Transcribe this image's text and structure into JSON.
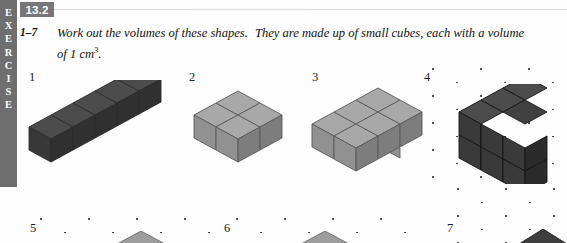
{
  "page": {
    "exercise_tab_letters": [
      "E",
      "X",
      "E",
      "R",
      "C",
      "I",
      "S",
      "E"
    ],
    "badge_label": "13.2",
    "question_range": "1–7",
    "instruction_line1": "Work out the volumes of these shapes.",
    "instruction_line1b": "They are made up of small cubes, each with a volume",
    "instruction_line2_pre": "of 1 cm",
    "instruction_line2_sup": "3",
    "instruction_line2_post": "."
  },
  "colors": {
    "tab_background": "#6e6e6e",
    "tab_text": "#ffffff",
    "badge_background": "#777777",
    "badge_text": "#ffffff",
    "page_background": "#fdfdfd",
    "dark_cube_top": "#4a4a4a",
    "dark_cube_left": "#3a3a3a",
    "dark_cube_right": "#2e2e2e",
    "light_cube_top": "#a6a6a6",
    "light_cube_left": "#8f8f8f",
    "light_cube_right": "#7d7d7d",
    "outline": "#4f4f4f",
    "dot_color": "#303030"
  },
  "shapes": [
    {
      "number": "1",
      "label_x": 29,
      "label_y": 70,
      "cube_count": 5,
      "description": "row of five dark cubes",
      "style": "dark",
      "grid": false
    },
    {
      "number": "2",
      "label_x": 189,
      "label_y": 70,
      "cube_count": 4,
      "description": "two by two block of light cubes",
      "style": "light",
      "grid": false
    },
    {
      "number": "3",
      "label_x": 312,
      "label_y": 70,
      "cube_count": 5,
      "description": "plus shaped arrangement of light cubes",
      "style": "light",
      "grid": false
    },
    {
      "number": "4",
      "label_x": 424,
      "label_y": 70,
      "cube_count": 6,
      "description": "three by two wall of dark cubes on isometric dot grid",
      "style": "dark",
      "grid": true
    },
    {
      "number": "5",
      "label_x": 30,
      "label_y": 221,
      "cube_count": null,
      "description": "shape on isometric dot grid cut off by page edge",
      "style": "light",
      "grid": true
    },
    {
      "number": "6",
      "label_x": 224,
      "label_y": 221,
      "cube_count": null,
      "description": "shape on isometric dot grid cut off by page edge",
      "style": "light",
      "grid": true
    },
    {
      "number": "7",
      "label_x": 447,
      "label_y": 221,
      "cube_count": null,
      "description": "shape on isometric dot grid cut off by page edge",
      "style": "dark",
      "grid": true
    }
  ]
}
